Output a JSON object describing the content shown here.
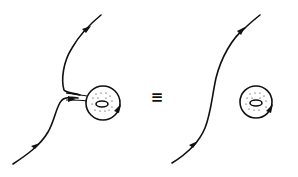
{
  "figure": {
    "left_panel": {
      "description": "curve with branch attached to a torus (annulus with hole)",
      "curve_arrows": 2,
      "torus_arrow": 1
    },
    "relation_symbol": "≡",
    "right_panel": {
      "description": "separated smooth curve and torus",
      "curve_arrows": 2,
      "torus_arrow": 1
    },
    "colors": {
      "ink": "#111111",
      "background": "#ffffff"
    }
  }
}
